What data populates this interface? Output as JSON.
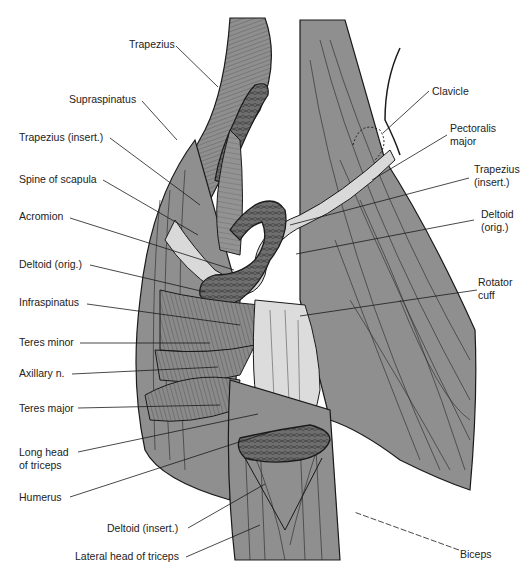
{
  "figure": {
    "type": "anatomical-illustration",
    "colors": {
      "muscle": "#8f8f8f",
      "muscle_dark": "#5f5f5f",
      "tendon": "#d9d9d9",
      "bone": "#6e6e6e",
      "line": "#1a1a1a",
      "background": "#ffffff"
    }
  },
  "labels": {
    "left": [
      {
        "id": "trapezius",
        "text": "Trapezius"
      },
      {
        "id": "supraspinatus",
        "text": "Supraspinatus"
      },
      {
        "id": "trapezius-insert-left",
        "text": "Trapezius (insert.)"
      },
      {
        "id": "spine-of-scapula",
        "text": "Spine of scapula"
      },
      {
        "id": "acromion",
        "text": "Acromion"
      },
      {
        "id": "deltoid-orig-left",
        "text": "Deltoid (orig.)"
      },
      {
        "id": "infraspinatus",
        "text": "Infraspinatus"
      },
      {
        "id": "teres-minor",
        "text": "Teres minor"
      },
      {
        "id": "axillary-n",
        "text": "Axillary n."
      },
      {
        "id": "teres-major",
        "text": "Teres major"
      },
      {
        "id": "long-head-triceps-1",
        "text": "Long head"
      },
      {
        "id": "long-head-triceps-2",
        "text": "of triceps"
      },
      {
        "id": "humerus",
        "text": "Humerus"
      },
      {
        "id": "deltoid-insert",
        "text": "Deltoid (insert.)"
      },
      {
        "id": "lateral-head-triceps",
        "text": "Lateral head of triceps"
      }
    ],
    "right": [
      {
        "id": "clavicle",
        "text": "Clavicle"
      },
      {
        "id": "pectoralis-major-1",
        "text": "Pectoralis"
      },
      {
        "id": "pectoralis-major-2",
        "text": "major"
      },
      {
        "id": "trapezius-insert-right-1",
        "text": "Trapezius"
      },
      {
        "id": "trapezius-insert-right-2",
        "text": "(insert.)"
      },
      {
        "id": "deltoid-orig-right-1",
        "text": "Deltoid"
      },
      {
        "id": "deltoid-orig-right-2",
        "text": "(orig.)"
      },
      {
        "id": "rotator-cuff-1",
        "text": "Rotator"
      },
      {
        "id": "rotator-cuff-2",
        "text": "cuff"
      },
      {
        "id": "biceps",
        "text": "Biceps"
      }
    ]
  }
}
